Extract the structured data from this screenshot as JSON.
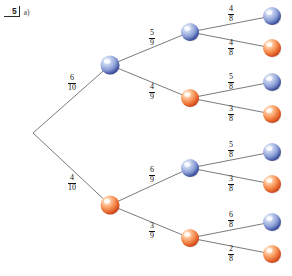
{
  "header": {
    "question_number": "5",
    "part_label": "a)"
  },
  "colors": {
    "blue_light": "#e8eefc",
    "blue_mid": "#93a9dd",
    "blue_dark": "#2b3f86",
    "orange_light": "#ffe6d2",
    "orange_mid": "#f4884a",
    "orange_dark": "#c8401a",
    "branch_line": "#6b6b6b",
    "text": "#111111"
  },
  "chart_data": {
    "type": "diagram",
    "levels": 3,
    "root": {
      "id": "root",
      "x": 33,
      "y": 133,
      "color": "none",
      "label": ""
    },
    "nodes": [
      {
        "id": "n1",
        "level": 1,
        "x": 110,
        "y": 65,
        "color": "blue"
      },
      {
        "id": "n2",
        "level": 1,
        "x": 110,
        "y": 205,
        "color": "orange"
      },
      {
        "id": "n11",
        "level": 2,
        "x": 190,
        "y": 32,
        "color": "blue"
      },
      {
        "id": "n12",
        "level": 2,
        "x": 190,
        "y": 98,
        "color": "orange"
      },
      {
        "id": "n21",
        "level": 2,
        "x": 190,
        "y": 168,
        "color": "blue"
      },
      {
        "id": "n22",
        "level": 2,
        "x": 190,
        "y": 238,
        "color": "orange"
      },
      {
        "id": "l1",
        "level": 3,
        "x": 272,
        "y": 16,
        "color": "blue"
      },
      {
        "id": "l2",
        "level": 3,
        "x": 272,
        "y": 48,
        "color": "orange"
      },
      {
        "id": "l3",
        "level": 3,
        "x": 272,
        "y": 82,
        "color": "blue"
      },
      {
        "id": "l4",
        "level": 3,
        "x": 272,
        "y": 114,
        "color": "orange"
      },
      {
        "id": "l5",
        "level": 3,
        "x": 272,
        "y": 152,
        "color": "blue"
      },
      {
        "id": "l6",
        "level": 3,
        "x": 272,
        "y": 184,
        "color": "orange"
      },
      {
        "id": "l7",
        "level": 3,
        "x": 272,
        "y": 222,
        "color": "blue"
      },
      {
        "id": "l8",
        "level": 3,
        "x": 272,
        "y": 254,
        "color": "orange"
      }
    ],
    "branches": [
      {
        "from": "root",
        "to": "n1",
        "numerator": "6",
        "denominator": "10",
        "label_x": 72,
        "label_y": 83,
        "to_color": "blue"
      },
      {
        "from": "root",
        "to": "n2",
        "numerator": "4",
        "denominator": "10",
        "label_x": 72,
        "label_y": 183,
        "to_color": "orange"
      },
      {
        "from": "n1",
        "to": "n11",
        "numerator": "5",
        "denominator": "9",
        "label_x": 152,
        "label_y": 38,
        "to_color": "blue"
      },
      {
        "from": "n1",
        "to": "n12",
        "numerator": "4",
        "denominator": "9",
        "label_x": 152,
        "label_y": 92,
        "to_color": "orange"
      },
      {
        "from": "n2",
        "to": "n21",
        "numerator": "6",
        "denominator": "9",
        "label_x": 152,
        "label_y": 175,
        "to_color": "blue"
      },
      {
        "from": "n2",
        "to": "n22",
        "numerator": "3",
        "denominator": "9",
        "label_x": 152,
        "label_y": 231,
        "to_color": "orange"
      },
      {
        "from": "n11",
        "to": "l1",
        "numerator": "4",
        "denominator": "8",
        "label_x": 231,
        "label_y": 14,
        "to_color": "blue"
      },
      {
        "from": "n11",
        "to": "l2",
        "numerator": "4",
        "denominator": "8",
        "label_x": 231,
        "label_y": 48,
        "to_color": "orange"
      },
      {
        "from": "n12",
        "to": "l3",
        "numerator": "5",
        "denominator": "8",
        "label_x": 231,
        "label_y": 82,
        "to_color": "blue"
      },
      {
        "from": "n12",
        "to": "l4",
        "numerator": "3",
        "denominator": "8",
        "label_x": 231,
        "label_y": 114,
        "to_color": "orange"
      },
      {
        "from": "n21",
        "to": "l5",
        "numerator": "5",
        "denominator": "8",
        "label_x": 231,
        "label_y": 150,
        "to_color": "blue"
      },
      {
        "from": "n21",
        "to": "l6",
        "numerator": "3",
        "denominator": "8",
        "label_x": 231,
        "label_y": 184,
        "to_color": "orange"
      },
      {
        "from": "n22",
        "to": "l7",
        "numerator": "6",
        "denominator": "8",
        "label_x": 231,
        "label_y": 220,
        "to_color": "blue"
      },
      {
        "from": "n22",
        "to": "l8",
        "numerator": "2",
        "denominator": "8",
        "label_x": 231,
        "label_y": 254,
        "to_color": "orange"
      }
    ]
  }
}
